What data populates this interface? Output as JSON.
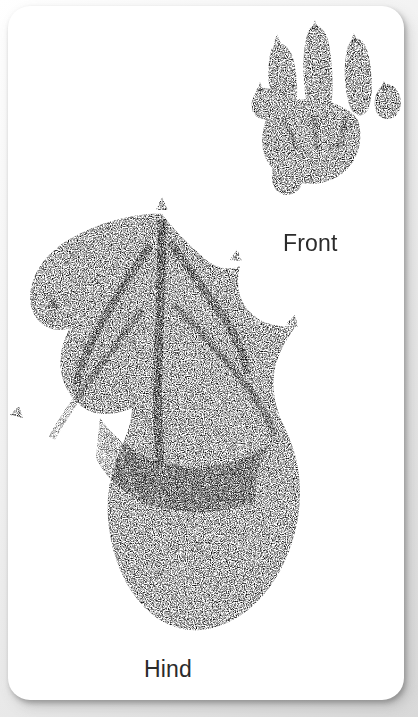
{
  "card": {
    "background_color": "#ffffff",
    "corner_radius_px": 22,
    "page_background_color": "#e2e2e2"
  },
  "labels": {
    "front": "Front",
    "hind": "Hind",
    "text_color": "#2b2b2b"
  },
  "prints": {
    "front": {
      "name": "Front",
      "toe_count": 5,
      "claw_count": 5,
      "description": "five-toed front paw print with splayed slender toes and a rounded palm pad",
      "ink_color": "#6e6e6e"
    },
    "hind": {
      "name": "Hind",
      "toe_count": 5,
      "claw_count": 5,
      "webbed": true,
      "description": "large webbed hind foot print with five clawed toes joined by webbing and a long heel pad",
      "ink_color": "#6e6e6e"
    }
  }
}
